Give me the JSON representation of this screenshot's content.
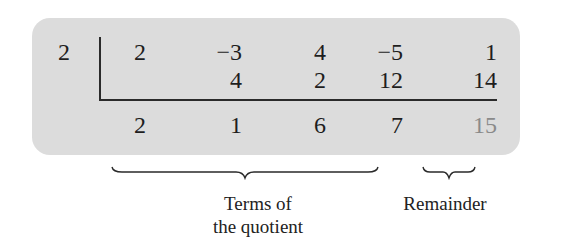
{
  "synthetic_division": {
    "divisor": "2",
    "coefficients": [
      "2",
      "−3",
      "4",
      "−5",
      "1"
    ],
    "products": [
      "",
      "4",
      "2",
      "12",
      "14"
    ],
    "results": [
      "2",
      "1",
      "6",
      "7",
      "15"
    ],
    "remainder_color": "#8a8a8a",
    "box_color": "#dcdcdc"
  },
  "annotations": {
    "quotient_label_line1": "Terms of",
    "quotient_label_line2": "the quotient",
    "remainder_label": "Remainder"
  }
}
